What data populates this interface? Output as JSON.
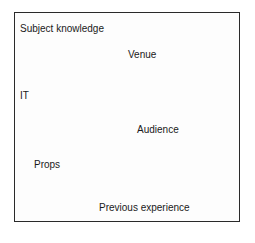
{
  "diagram": {
    "labels": [
      "Subject knowledge",
      "Venue",
      "IT",
      "Audience",
      "Props",
      "Previous experience"
    ]
  }
}
